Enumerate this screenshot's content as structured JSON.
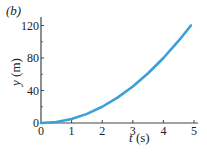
{
  "panel_label": "(b)",
  "chart_data": {
    "type": "line",
    "title": "",
    "panel_label": "(b)",
    "xlabel": "t (s)",
    "ylabel": "y (m)",
    "xlim": [
      0,
      5.1
    ],
    "ylim": [
      0,
      130
    ],
    "x_ticks": [
      0,
      1,
      2,
      3,
      4,
      5
    ],
    "y_ticks": [
      0,
      40,
      80,
      120
    ],
    "y_minor_ticks": [
      20,
      60,
      100
    ],
    "grid": false,
    "series": [
      {
        "name": "y(t)",
        "color": "#3aa0d8",
        "x": [
          0,
          0.5,
          1,
          1.5,
          2,
          2.5,
          3,
          3.5,
          4,
          4.5,
          4.9
        ],
        "y": [
          0,
          1.25,
          5,
          11.25,
          20,
          31.25,
          45,
          61.25,
          80,
          101.25,
          120
        ]
      }
    ]
  }
}
